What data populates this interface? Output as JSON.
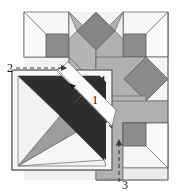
{
  "figure": {
    "canvas": {
      "width": 181,
      "height": 194
    },
    "background": "#ffffff"
  },
  "palette": {
    "paper_white": "#f5f5f5",
    "paper_light": "#ececec",
    "paper_mid": "#b7b7b7",
    "paper_mid2": "#a8a8a8",
    "paper_gray": "#9a9a9a",
    "paper_dark": "#6e6e6e",
    "paper_darker": "#575757",
    "ink_black": "#2a2a2a",
    "outline": "#555555",
    "arrow": "#4a4a4a",
    "label": "#1a1a1a"
  },
  "arrows": [
    {
      "id": "arrow-1",
      "label": "1",
      "direction": "up-left",
      "style": "dashed"
    },
    {
      "id": "arrow-2",
      "label": "2",
      "direction": "right",
      "style": "dashed"
    },
    {
      "id": "arrow-3",
      "label": "3",
      "direction": "up",
      "style": "dashed"
    }
  ],
  "labels": {
    "one": "1",
    "two": "2",
    "three": "3"
  }
}
